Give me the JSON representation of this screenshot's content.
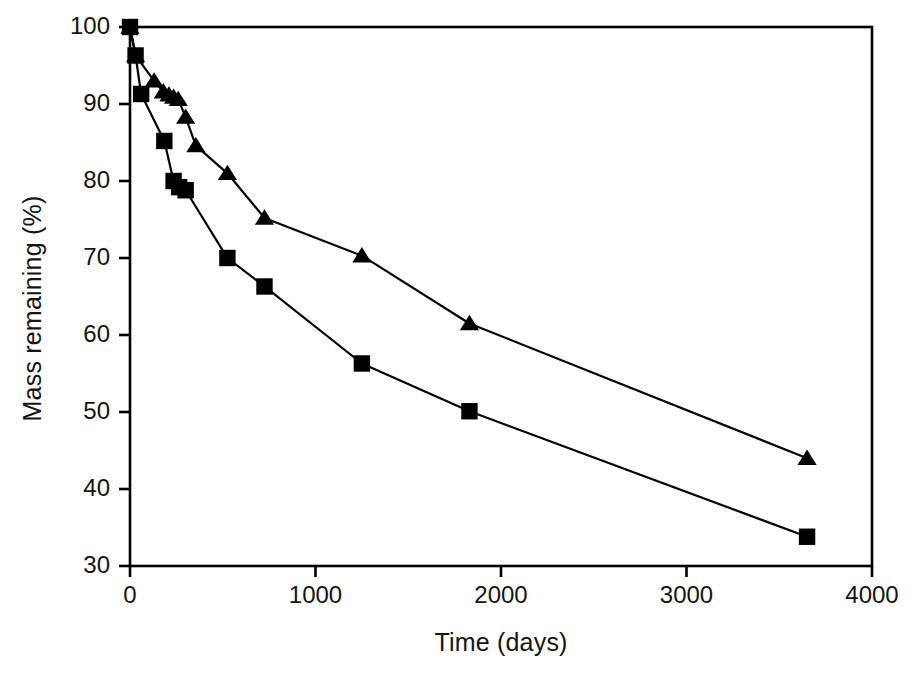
{
  "chart_data": {
    "type": "line",
    "title": "",
    "xlabel": "Time (days)",
    "ylabel": "Mass remaining (%)",
    "xlim": [
      0,
      4000
    ],
    "ylim": [
      30,
      100
    ],
    "xticks": [
      0,
      1000,
      2000,
      3000,
      4000
    ],
    "yticks": [
      30,
      40,
      50,
      60,
      70,
      80,
      90,
      100
    ],
    "xtick_labels": [
      "0",
      "1000",
      "2000",
      "3000",
      "4000"
    ],
    "ytick_labels": [
      "30",
      "40",
      "50",
      "60",
      "70",
      "80",
      "90",
      "100"
    ],
    "grid": false,
    "legend": "none",
    "frame": true,
    "line_color": "#000000",
    "marker_color": "#000000",
    "series": [
      {
        "name": "triangle-series",
        "marker": "triangle",
        "points": [
          [
            0,
            100.0
          ],
          [
            30,
            96.3
          ],
          [
            130,
            93.0
          ],
          [
            180,
            91.6
          ],
          [
            210,
            91.2
          ],
          [
            235,
            90.9
          ],
          [
            260,
            90.6
          ],
          [
            300,
            88.3
          ],
          [
            355,
            84.6
          ],
          [
            525,
            81.0
          ],
          [
            725,
            75.2
          ],
          [
            1250,
            70.3
          ],
          [
            1830,
            61.5
          ],
          [
            3650,
            44.0
          ]
        ]
      },
      {
        "name": "square-series",
        "marker": "square",
        "points": [
          [
            0,
            100.0
          ],
          [
            30,
            96.3
          ],
          [
            60,
            91.3
          ],
          [
            185,
            85.2
          ],
          [
            235,
            80.0
          ],
          [
            265,
            79.2
          ],
          [
            300,
            78.8
          ],
          [
            525,
            70.0
          ],
          [
            725,
            66.3
          ],
          [
            1250,
            56.3
          ],
          [
            1830,
            50.1
          ],
          [
            3650,
            33.8
          ]
        ]
      }
    ]
  }
}
